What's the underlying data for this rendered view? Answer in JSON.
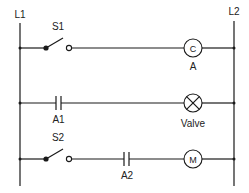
{
  "diagram": {
    "type": "ladder-logic",
    "rails": {
      "left": {
        "label": "L1"
      },
      "right": {
        "label": "L2"
      }
    },
    "rungs": [
      {
        "elements": [
          {
            "kind": "switch-open",
            "label": "S1"
          },
          {
            "kind": "coil",
            "symbol": "C",
            "label": "A"
          }
        ]
      },
      {
        "elements": [
          {
            "kind": "contact-no",
            "label": "A1"
          },
          {
            "kind": "lamp",
            "label": "Valve"
          }
        ]
      },
      {
        "elements": [
          {
            "kind": "switch-open",
            "label": "S2"
          },
          {
            "kind": "contact-no",
            "label": "A2"
          },
          {
            "kind": "motor",
            "symbol": "M",
            "label": ""
          }
        ]
      }
    ],
    "colors": {
      "line": "#1a1a1a",
      "text": "#222222",
      "background": "#ffffff"
    }
  }
}
